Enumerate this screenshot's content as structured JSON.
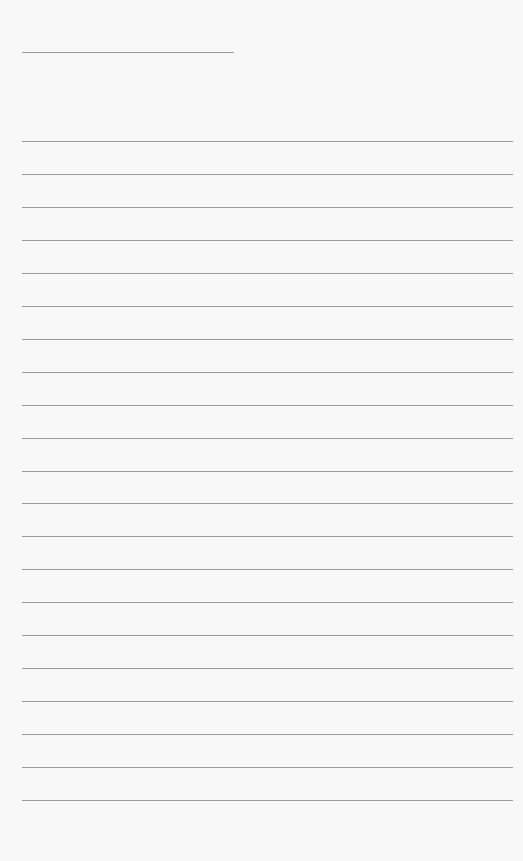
{
  "page": {
    "type": "lined-paper",
    "background_color": "#f8f8f8",
    "line_color": "#9a9a9a",
    "title_line": {
      "x": 22,
      "y": 52,
      "width": 212
    },
    "rules": {
      "x": 22,
      "width": 491,
      "first_y": 141,
      "spacing": 32.95,
      "count": 21
    }
  }
}
